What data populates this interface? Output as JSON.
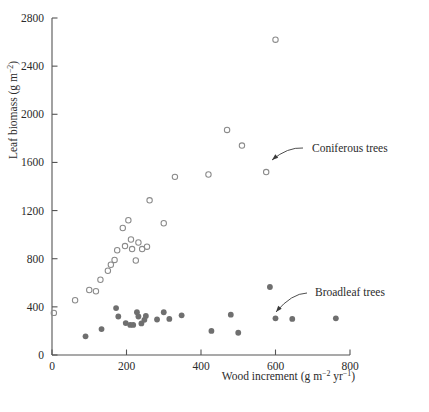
{
  "figure": {
    "background_color": "#ffffff",
    "open_marker_color": "#8a8a8a",
    "closed_marker_color": "#6f6f6f",
    "axis_color": "#555555"
  },
  "annotations": [
    {
      "id": "coniferous",
      "label": "Coniferous trees",
      "label_x": 312,
      "label_y": 152,
      "leader_from_x": 303,
      "leader_from_y": 148,
      "leader_to_x": 272,
      "leader_to_y": 160
    },
    {
      "id": "broadleaf",
      "label": "Broadleaf trees",
      "label_x": 315,
      "label_y": 296,
      "leader_from_x": 307,
      "leader_from_y": 293,
      "leader_to_x": 276,
      "leader_to_y": 312
    }
  ],
  "chart_data": {
    "type": "scatter",
    "title": "",
    "xlabel": "Wood increment (g m⁻² yr⁻¹)",
    "ylabel": "Leaf biomass (g m⁻²)",
    "xlabel_parts": {
      "text": "Wood increment (g m",
      "sup1": "−2",
      "mid": " yr",
      "sup2": "−1",
      "tail": ")"
    },
    "ylabel_parts": {
      "text": "Leaf biomass (g m",
      "sup1": "−2",
      "tail": ")"
    },
    "xlim": [
      0,
      800
    ],
    "ylim": [
      0,
      2800
    ],
    "xticks": [
      0,
      200,
      400,
      600,
      800
    ],
    "yticks": [
      0,
      400,
      800,
      1200,
      1600,
      2000,
      2400,
      2800
    ],
    "xticklabels": [
      "0",
      "200",
      "400",
      "600",
      "800"
    ],
    "yticklabels": [
      "0",
      "400",
      "800",
      "1200",
      "1600",
      "2000",
      "2400",
      "2800"
    ],
    "grid": false,
    "legend": "annotated",
    "series": [
      {
        "name": "Coniferous trees",
        "marker": "open-circle",
        "color": "#8a8a8a",
        "points": [
          [
            5,
            350
          ],
          [
            62,
            455
          ],
          [
            100,
            540
          ],
          [
            118,
            530
          ],
          [
            130,
            625
          ],
          [
            150,
            700
          ],
          [
            158,
            750
          ],
          [
            168,
            790
          ],
          [
            175,
            870
          ],
          [
            190,
            1055
          ],
          [
            196,
            905
          ],
          [
            205,
            1120
          ],
          [
            212,
            960
          ],
          [
            215,
            880
          ],
          [
            225,
            785
          ],
          [
            232,
            935
          ],
          [
            242,
            880
          ],
          [
            255,
            900
          ],
          [
            262,
            1285
          ],
          [
            300,
            1095
          ],
          [
            330,
            1480
          ],
          [
            420,
            1500
          ],
          [
            470,
            1870
          ],
          [
            510,
            1740
          ],
          [
            575,
            1520
          ],
          [
            600,
            2620
          ]
        ]
      },
      {
        "name": "Broadleaf trees",
        "marker": "filled-circle",
        "color": "#6f6f6f",
        "points": [
          [
            90,
            155
          ],
          [
            133,
            215
          ],
          [
            172,
            390
          ],
          [
            178,
            320
          ],
          [
            198,
            265
          ],
          [
            210,
            250
          ],
          [
            218,
            250
          ],
          [
            228,
            355
          ],
          [
            232,
            320
          ],
          [
            240,
            262
          ],
          [
            248,
            292
          ],
          [
            252,
            325
          ],
          [
            282,
            295
          ],
          [
            300,
            355
          ],
          [
            315,
            300
          ],
          [
            348,
            330
          ],
          [
            428,
            200
          ],
          [
            480,
            335
          ],
          [
            500,
            185
          ],
          [
            585,
            565
          ],
          [
            600,
            305
          ],
          [
            645,
            300
          ],
          [
            762,
            305
          ]
        ]
      }
    ]
  }
}
